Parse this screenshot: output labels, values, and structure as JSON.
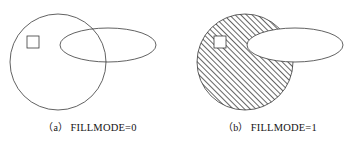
{
  "figure": {
    "background_color": "#ffffff",
    "stroke_color": "#3a3a3a",
    "hatch_color": "#4a4a4a",
    "panels": [
      {
        "id": "a",
        "caption_tag": "（a）",
        "caption_text": "FILLMODE=0",
        "fillmode_value": "0",
        "shapes": {
          "circle": {
            "name": "circle",
            "cx": 58,
            "cy": 62,
            "r": 48,
            "filled": false,
            "fill": "none"
          },
          "ellipse": {
            "name": "ellipse",
            "cx": 108,
            "cy": 45,
            "rx": 48,
            "ry": 17,
            "filled": false,
            "fill": "none"
          },
          "square": {
            "name": "square",
            "x": 27,
            "y": 36,
            "width": 12,
            "height": 12,
            "filled": false,
            "fill": "none"
          }
        }
      },
      {
        "id": "b",
        "caption_tag": "（b）",
        "caption_text": "FILLMODE=1",
        "fillmode_value": "1",
        "shapes": {
          "circle": {
            "name": "circle",
            "cx": 65,
            "cy": 62,
            "r": 48,
            "filled": true,
            "fill": "diagonal-hatch"
          },
          "ellipse": {
            "name": "ellipse",
            "cx": 115,
            "cy": 45,
            "rx": 48,
            "ry": 17,
            "filled": true,
            "fill": "#ffffff"
          },
          "square": {
            "name": "square",
            "x": 34,
            "y": 36,
            "width": 12,
            "height": 12,
            "filled": true,
            "fill": "#ffffff"
          }
        }
      }
    ]
  }
}
